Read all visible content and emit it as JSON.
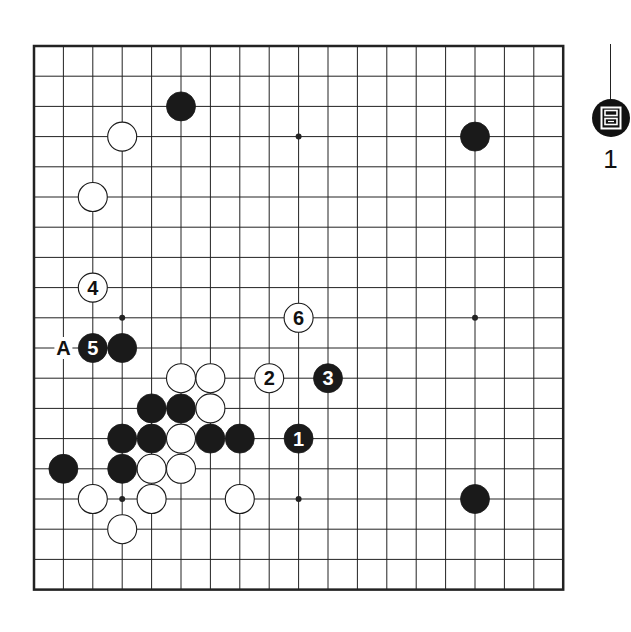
{
  "figure": {
    "label_glyph": "图",
    "number": "1"
  },
  "board": {
    "size": 19,
    "origin_x": 34,
    "origin_y": 46,
    "step_x": 29.4,
    "step_y": 30.2,
    "colors": {
      "line": "#222222",
      "black_stone": "#1a1a1a",
      "white_stone": "#ffffff",
      "border": "#222222"
    },
    "star_points": [
      {
        "col": 3,
        "row": 3
      },
      {
        "col": 9,
        "row": 3
      },
      {
        "col": 15,
        "row": 3
      },
      {
        "col": 3,
        "row": 9
      },
      {
        "col": 9,
        "row": 9
      },
      {
        "col": 15,
        "row": 9
      },
      {
        "col": 3,
        "row": 15
      },
      {
        "col": 9,
        "row": 15
      },
      {
        "col": 15,
        "row": 15
      }
    ],
    "stones": [
      {
        "color": "black",
        "col": 5,
        "row": 2,
        "label": ""
      },
      {
        "color": "white",
        "col": 3,
        "row": 3,
        "label": ""
      },
      {
        "color": "black",
        "col": 15,
        "row": 3,
        "label": ""
      },
      {
        "color": "white",
        "col": 2,
        "row": 5,
        "label": ""
      },
      {
        "color": "white",
        "col": 2,
        "row": 8,
        "label": "4"
      },
      {
        "color": "white",
        "col": 9,
        "row": 9,
        "label": "6"
      },
      {
        "color": "black",
        "col": 2,
        "row": 10,
        "label": "5"
      },
      {
        "color": "black",
        "col": 3,
        "row": 10,
        "label": ""
      },
      {
        "color": "white",
        "col": 5,
        "row": 11,
        "label": ""
      },
      {
        "color": "white",
        "col": 6,
        "row": 11,
        "label": ""
      },
      {
        "color": "white",
        "col": 8,
        "row": 11,
        "label": "2"
      },
      {
        "color": "black",
        "col": 10,
        "row": 11,
        "label": "3"
      },
      {
        "color": "black",
        "col": 4,
        "row": 12,
        "label": ""
      },
      {
        "color": "black",
        "col": 5,
        "row": 12,
        "label": ""
      },
      {
        "color": "white",
        "col": 6,
        "row": 12,
        "label": ""
      },
      {
        "color": "black",
        "col": 3,
        "row": 13,
        "label": ""
      },
      {
        "color": "black",
        "col": 4,
        "row": 13,
        "label": ""
      },
      {
        "color": "white",
        "col": 5,
        "row": 13,
        "label": ""
      },
      {
        "color": "black",
        "col": 6,
        "row": 13,
        "label": ""
      },
      {
        "color": "black",
        "col": 7,
        "row": 13,
        "label": ""
      },
      {
        "color": "black",
        "col": 9,
        "row": 13,
        "label": "1"
      },
      {
        "color": "black",
        "col": 1,
        "row": 14,
        "label": ""
      },
      {
        "color": "black",
        "col": 3,
        "row": 14,
        "label": ""
      },
      {
        "color": "white",
        "col": 4,
        "row": 14,
        "label": ""
      },
      {
        "color": "white",
        "col": 5,
        "row": 14,
        "label": ""
      },
      {
        "color": "white",
        "col": 2,
        "row": 15,
        "label": ""
      },
      {
        "color": "white",
        "col": 4,
        "row": 15,
        "label": ""
      },
      {
        "color": "white",
        "col": 7,
        "row": 15,
        "label": ""
      },
      {
        "color": "black",
        "col": 15,
        "row": 15,
        "label": ""
      },
      {
        "color": "white",
        "col": 3,
        "row": 16,
        "label": ""
      }
    ],
    "point_labels": [
      {
        "text": "A",
        "col": 1,
        "row": 10
      }
    ]
  }
}
